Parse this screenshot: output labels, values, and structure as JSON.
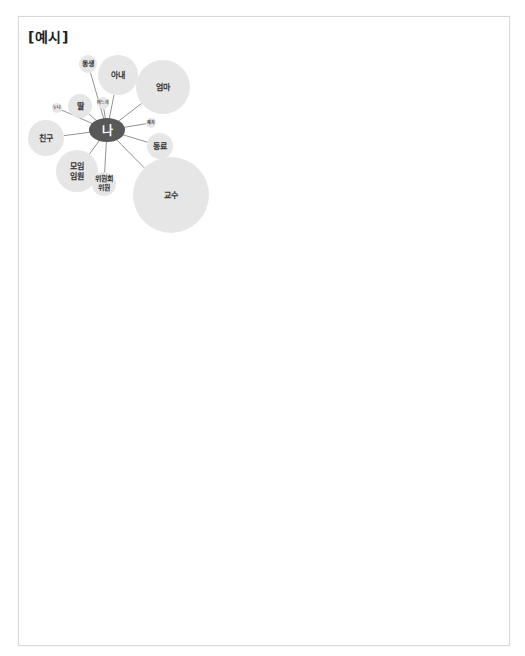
{
  "title": "[예시]",
  "diagram": {
    "center": {
      "label": "나",
      "cx": 107,
      "cy": 130,
      "rx": 18,
      "ry": 12,
      "color": "#585858"
    },
    "nodes": [
      {
        "label": "동생",
        "cx": 88,
        "cy": 64,
        "r": 9,
        "font": 7
      },
      {
        "label": "아내",
        "cx": 118,
        "cy": 75,
        "r": 20,
        "font": 8
      },
      {
        "label": "엄마",
        "cx": 163,
        "cy": 87,
        "r": 27,
        "font": 8
      },
      {
        "label": "누나",
        "cx": 57,
        "cy": 108,
        "r": 5,
        "font": 4
      },
      {
        "label": "딸",
        "cx": 80,
        "cy": 106,
        "r": 12,
        "font": 8
      },
      {
        "label": "며느리",
        "cx": 103,
        "cy": 103,
        "r": 6,
        "font": 4
      },
      {
        "label": "제자",
        "cx": 151,
        "cy": 123,
        "r": 5,
        "font": 4
      },
      {
        "label": "친구",
        "cx": 46,
        "cy": 138,
        "r": 18,
        "font": 8
      },
      {
        "label": "동료",
        "cx": 160,
        "cy": 146,
        "r": 13,
        "font": 8
      },
      {
        "label": "모임\n임원",
        "cx": 77,
        "cy": 171,
        "r": 21,
        "font": 8
      },
      {
        "label": "위원회\n위원",
        "cx": 104,
        "cy": 184,
        "r": 12,
        "font": 7
      },
      {
        "label": "교수",
        "cx": 171,
        "cy": 195,
        "r": 38,
        "font": 8
      }
    ],
    "bubble_color": "#e6e6e6",
    "edge_color": "#777777"
  }
}
